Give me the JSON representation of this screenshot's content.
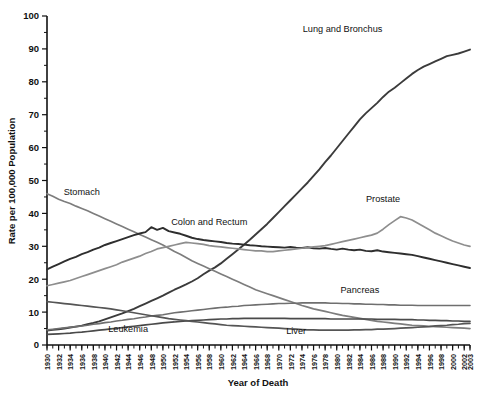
{
  "chart_data": {
    "type": "line",
    "title": "",
    "xlabel": "Year of Death",
    "ylabel": "Rate per 100,000 Population",
    "xlim": [
      1930,
      2003
    ],
    "ylim": [
      0,
      100
    ],
    "grid": false,
    "legend_position": "inline-annotations",
    "y_ticks": [
      0,
      10,
      20,
      30,
      40,
      50,
      60,
      70,
      80,
      90,
      100
    ],
    "y_tick_labels": [
      "0",
      "10",
      "20",
      "30",
      "40",
      "50",
      "60",
      "70",
      "80",
      "90",
      "100"
    ],
    "y_minor_step": 5,
    "x_tick_labels": [
      "1930",
      "1932",
      "1934",
      "1936",
      "1938",
      "1940",
      "1942",
      "1944",
      "1946",
      "1948",
      "1950",
      "1952",
      "1954",
      "1956",
      "1958",
      "1960",
      "1962",
      "1964",
      "1966",
      "1968",
      "1970",
      "1972",
      "1974",
      "1976",
      "1978",
      "1980",
      "1982",
      "1984",
      "1986",
      "1988",
      "1990",
      "1992",
      "1994",
      "1996",
      "1998",
      "2000",
      "2002",
      "2003"
    ],
    "x_tick_values": [
      1930,
      1932,
      1934,
      1936,
      1938,
      1940,
      1942,
      1944,
      1946,
      1948,
      1950,
      1952,
      1954,
      1956,
      1958,
      1960,
      1962,
      1964,
      1966,
      1968,
      1970,
      1972,
      1974,
      1976,
      1978,
      1980,
      1982,
      1984,
      1986,
      1988,
      1990,
      1992,
      1994,
      1996,
      1998,
      2000,
      2002,
      2003
    ],
    "x_minor_step": 1,
    "years": [
      1930,
      1931,
      1932,
      1933,
      1934,
      1935,
      1936,
      1937,
      1938,
      1939,
      1940,
      1941,
      1942,
      1943,
      1944,
      1945,
      1946,
      1947,
      1948,
      1949,
      1950,
      1951,
      1952,
      1953,
      1954,
      1955,
      1956,
      1957,
      1958,
      1959,
      1960,
      1961,
      1962,
      1963,
      1964,
      1965,
      1966,
      1967,
      1968,
      1969,
      1970,
      1971,
      1972,
      1973,
      1974,
      1975,
      1976,
      1977,
      1978,
      1979,
      1980,
      1981,
      1982,
      1983,
      1984,
      1985,
      1986,
      1987,
      1988,
      1989,
      1990,
      1991,
      1992,
      1993,
      1994,
      1995,
      1996,
      1997,
      1998,
      1999,
      2000,
      2001,
      2002,
      2003
    ],
    "series": [
      {
        "name": "Lung and Bronchus",
        "color": "#3b3b3b",
        "width": 1.9,
        "label_x": 1981,
        "label_y": 95,
        "values": [
          4.4,
          4.6,
          4.8,
          5.0,
          5.3,
          5.6,
          5.9,
          6.3,
          6.7,
          7.2,
          7.8,
          8.4,
          9.0,
          9.6,
          10.3,
          11.0,
          11.8,
          12.6,
          13.4,
          14.2,
          15.0,
          15.9,
          16.8,
          17.6,
          18.4,
          19.3,
          20.3,
          21.5,
          22.6,
          23.6,
          24.8,
          26.2,
          27.6,
          29.0,
          30.5,
          32.0,
          33.6,
          35.2,
          36.8,
          38.6,
          40.4,
          42.2,
          44.0,
          45.8,
          47.6,
          49.4,
          51.4,
          53.4,
          55.6,
          57.6,
          59.8,
          62.0,
          64.2,
          66.4,
          68.6,
          70.4,
          72.0,
          73.6,
          75.4,
          77.0,
          78.2,
          79.6,
          81.0,
          82.4,
          83.6,
          84.6,
          85.4,
          86.2,
          87.0,
          87.8,
          88.2,
          88.6,
          89.2,
          89.8
        ]
      },
      {
        "name": "Stomach",
        "color": "#7d7d7d",
        "width": 1.7,
        "label_x": 1936,
        "label_y": 45.5,
        "values": [
          46.0,
          45.2,
          44.3,
          43.6,
          43.0,
          42.2,
          41.5,
          40.8,
          40.0,
          39.2,
          38.4,
          37.6,
          36.8,
          36.0,
          35.2,
          34.4,
          33.6,
          32.8,
          32.0,
          31.2,
          30.4,
          29.4,
          28.4,
          27.6,
          26.6,
          25.6,
          24.8,
          24.0,
          23.2,
          22.4,
          21.6,
          20.8,
          20.0,
          19.2,
          18.4,
          17.6,
          16.8,
          16.2,
          15.6,
          15.0,
          14.4,
          13.8,
          13.2,
          12.6,
          12.0,
          11.5,
          11.0,
          10.6,
          10.2,
          9.8,
          9.4,
          9.0,
          8.7,
          8.4,
          8.1,
          7.8,
          7.5,
          7.2,
          7.0,
          6.8,
          6.6,
          6.4,
          6.2,
          6.0,
          5.9,
          5.8,
          5.7,
          5.6,
          5.5,
          5.4,
          5.3,
          5.2,
          5.1,
          5.0
        ]
      },
      {
        "name": "Colon and Rectum",
        "color": "#2e2e2e",
        "width": 1.9,
        "label_x": 1958,
        "label_y": 36.5,
        "values": [
          23.0,
          23.8,
          24.6,
          25.4,
          26.2,
          26.8,
          27.6,
          28.2,
          29.0,
          29.6,
          30.4,
          31.0,
          31.6,
          32.2,
          32.8,
          33.4,
          33.9,
          34.3,
          35.8,
          35.0,
          35.6,
          34.6,
          34.2,
          33.8,
          33.2,
          32.6,
          32.2,
          31.9,
          31.7,
          31.5,
          31.3,
          31.0,
          30.8,
          30.7,
          30.5,
          30.3,
          30.2,
          30.0,
          29.9,
          29.8,
          29.7,
          29.6,
          29.8,
          29.6,
          29.5,
          29.7,
          29.4,
          29.3,
          29.5,
          29.2,
          29.0,
          29.3,
          29.0,
          28.8,
          29.0,
          28.6,
          28.5,
          28.8,
          28.4,
          28.2,
          28.0,
          27.8,
          27.6,
          27.4,
          27.0,
          26.6,
          26.2,
          25.8,
          25.4,
          25.0,
          24.6,
          24.2,
          23.8,
          23.4
        ]
      },
      {
        "name": "Prostate",
        "color": "#8e8e8e",
        "width": 1.7,
        "label_x": 1988,
        "label_y": 43.5,
        "values": [
          18.0,
          18.4,
          18.8,
          19.2,
          19.6,
          20.2,
          20.8,
          21.4,
          22.0,
          22.6,
          23.2,
          23.8,
          24.4,
          25.2,
          25.8,
          26.4,
          27.0,
          27.8,
          28.4,
          29.2,
          29.6,
          30.0,
          30.4,
          30.8,
          31.2,
          31.0,
          30.8,
          30.6,
          30.2,
          30.0,
          29.8,
          29.6,
          29.4,
          29.2,
          29.0,
          28.8,
          28.6,
          28.6,
          28.4,
          28.4,
          28.6,
          28.8,
          29.0,
          29.2,
          29.4,
          29.6,
          29.8,
          30.0,
          30.2,
          30.6,
          31.0,
          31.4,
          31.8,
          32.2,
          32.6,
          33.0,
          33.4,
          34.0,
          35.2,
          36.6,
          37.8,
          39.0,
          38.6,
          38.0,
          37.0,
          36.0,
          35.0,
          34.0,
          33.2,
          32.4,
          31.6,
          31.0,
          30.4,
          30.0
        ]
      },
      {
        "name": "Pancreas",
        "color": "#6f6f6f",
        "width": 1.6,
        "label_x": 1984,
        "label_y": 15.8,
        "values": [
          4.6,
          4.8,
          5.0,
          5.2,
          5.4,
          5.6,
          5.8,
          6.0,
          6.3,
          6.5,
          6.8,
          7.0,
          7.3,
          7.5,
          7.8,
          8.0,
          8.3,
          8.5,
          8.8,
          9.0,
          9.2,
          9.5,
          9.8,
          10.0,
          10.2,
          10.4,
          10.6,
          10.8,
          11.0,
          11.2,
          11.4,
          11.5,
          11.7,
          11.8,
          12.0,
          12.1,
          12.2,
          12.3,
          12.4,
          12.5,
          12.6,
          12.6,
          12.7,
          12.7,
          12.8,
          12.8,
          12.8,
          12.8,
          12.8,
          12.7,
          12.7,
          12.6,
          12.6,
          12.5,
          12.5,
          12.4,
          12.4,
          12.3,
          12.3,
          12.2,
          12.2,
          12.1,
          12.1,
          12.1,
          12.0,
          12.0,
          12.0,
          12.0,
          12.0,
          12.0,
          12.0,
          12.0,
          12.0,
          12.0
        ]
      },
      {
        "name": "Leukemia",
        "color": "#4a4a4a",
        "width": 1.7,
        "label_x": 1944,
        "label_y": 4.0,
        "values": [
          3.2,
          3.3,
          3.4,
          3.5,
          3.6,
          3.8,
          3.9,
          4.1,
          4.3,
          4.5,
          4.7,
          4.9,
          5.1,
          5.3,
          5.5,
          5.7,
          5.9,
          6.1,
          6.3,
          6.5,
          6.7,
          6.9,
          7.0,
          7.2,
          7.3,
          7.4,
          7.5,
          7.6,
          7.7,
          7.8,
          7.9,
          7.9,
          8.0,
          8.0,
          8.1,
          8.1,
          8.1,
          8.1,
          8.1,
          8.1,
          8.1,
          8.1,
          8.0,
          8.0,
          8.0,
          8.0,
          8.0,
          8.0,
          8.0,
          7.9,
          7.9,
          7.9,
          7.9,
          7.9,
          7.9,
          7.9,
          7.9,
          7.8,
          7.8,
          7.8,
          7.8,
          7.7,
          7.7,
          7.7,
          7.6,
          7.6,
          7.5,
          7.5,
          7.4,
          7.4,
          7.3,
          7.3,
          7.2,
          7.2
        ]
      },
      {
        "name": "Liver",
        "color": "#555555",
        "width": 1.7,
        "label_x": 1973,
        "label_y": 3.4,
        "values": [
          13.2,
          13.0,
          12.8,
          12.6,
          12.4,
          12.2,
          12.0,
          11.8,
          11.6,
          11.4,
          11.2,
          11.0,
          10.7,
          10.4,
          10.1,
          9.8,
          9.5,
          9.2,
          8.9,
          8.6,
          8.3,
          8.0,
          7.8,
          7.6,
          7.4,
          7.2,
          7.0,
          6.8,
          6.6,
          6.4,
          6.2,
          6.0,
          5.9,
          5.8,
          5.7,
          5.6,
          5.5,
          5.4,
          5.3,
          5.2,
          5.1,
          5.0,
          4.9,
          4.8,
          4.7,
          4.6,
          4.6,
          4.5,
          4.5,
          4.5,
          4.5,
          4.5,
          4.5,
          4.6,
          4.6,
          4.7,
          4.7,
          4.8,
          4.8,
          4.9,
          5.0,
          5.1,
          5.2,
          5.3,
          5.4,
          5.5,
          5.6,
          5.8,
          5.9,
          6.0,
          6.2,
          6.3,
          6.5,
          6.6
        ]
      }
    ],
    "annotations": [
      "Lung and Bronchus",
      "Stomach",
      "Colon and Rectum",
      "Prostate",
      "Pancreas",
      "Leukemia",
      "Liver"
    ]
  },
  "figure": {
    "caption": ""
  }
}
